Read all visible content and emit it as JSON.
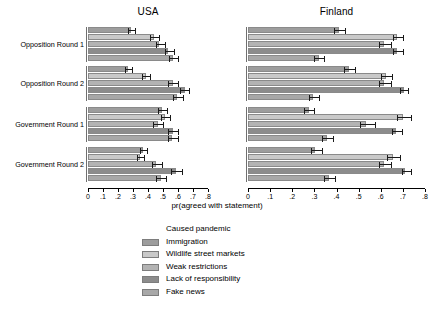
{
  "chart_data": {
    "type": "bar",
    "orientation": "horizontal",
    "title": "",
    "xlabel": "pr(agreed with statement)",
    "ylabel": "",
    "xlim": [
      0,
      0.8
    ],
    "xticks": [
      "0",
      ".1",
      ".2",
      ".3",
      ".4",
      ".5",
      ".6",
      ".7",
      ".8"
    ],
    "xtick_values": [
      0,
      0.1,
      0.2,
      0.3,
      0.4,
      0.5,
      0.6,
      0.7,
      0.8
    ],
    "grid": false,
    "legend_title": "Caused pandemic",
    "legend_position": "bottom",
    "panels": [
      "USA",
      "Finland"
    ],
    "categories": [
      "Opposition Round 1",
      "Opposition Round 2",
      "Government Round 1",
      "Government Round 2"
    ],
    "series_names": [
      "Immigration",
      "Wildlife street markets",
      "Weak restrictions",
      "Lack of responsibility",
      "Fake news"
    ],
    "series_colors": [
      "#9d9d9d",
      "#c9c9c9",
      "#b3b3b3",
      "#8c8c8c",
      "#a8a8a8"
    ],
    "data": {
      "USA": {
        "Opposition Round 1": {
          "values": [
            0.285,
            0.44,
            0.475,
            0.535,
            0.565
          ],
          "ci_low": [
            0.265,
            0.415,
            0.45,
            0.51,
            0.54
          ],
          "ci_high": [
            0.315,
            0.475,
            0.51,
            0.575,
            0.6
          ]
        },
        "Opposition Round 2": {
          "values": [
            0.265,
            0.385,
            0.565,
            0.645,
            0.595
          ],
          "ci_low": [
            0.245,
            0.36,
            0.535,
            0.615,
            0.565
          ],
          "ci_high": [
            0.29,
            0.415,
            0.6,
            0.675,
            0.63
          ]
        },
        "Government Round 1": {
          "values": [
            0.49,
            0.51,
            0.465,
            0.565,
            0.56
          ],
          "ci_low": [
            0.465,
            0.485,
            0.435,
            0.535,
            0.53
          ],
          "ci_high": [
            0.525,
            0.545,
            0.5,
            0.6,
            0.6
          ]
        },
        "Government Round 2": {
          "values": [
            0.365,
            0.345,
            0.455,
            0.585,
            0.485
          ],
          "ci_low": [
            0.345,
            0.325,
            0.425,
            0.555,
            0.455
          ],
          "ci_high": [
            0.395,
            0.375,
            0.49,
            0.625,
            0.52
          ]
        }
      },
      "Finland": {
        "Opposition Round 1": {
          "values": [
            0.41,
            0.675,
            0.615,
            0.675,
            0.32
          ],
          "ci_low": [
            0.39,
            0.655,
            0.59,
            0.655,
            0.3
          ],
          "ci_high": [
            0.44,
            0.7,
            0.645,
            0.7,
            0.345
          ]
        },
        "Opposition Round 2": {
          "values": [
            0.455,
            0.625,
            0.615,
            0.705,
            0.295
          ],
          "ci_low": [
            0.435,
            0.6,
            0.59,
            0.685,
            0.275
          ],
          "ci_high": [
            0.485,
            0.65,
            0.645,
            0.725,
            0.32
          ]
        },
        "Government Round 1": {
          "values": [
            0.275,
            0.7,
            0.535,
            0.67,
            0.355
          ],
          "ci_low": [
            0.255,
            0.675,
            0.505,
            0.65,
            0.335
          ],
          "ci_high": [
            0.3,
            0.735,
            0.575,
            0.695,
            0.385
          ]
        },
        "Government Round 2": {
          "values": [
            0.305,
            0.655,
            0.615,
            0.71,
            0.365
          ],
          "ci_low": [
            0.285,
            0.63,
            0.59,
            0.695,
            0.345
          ],
          "ci_high": [
            0.335,
            0.685,
            0.645,
            0.735,
            0.395
          ]
        }
      }
    }
  }
}
